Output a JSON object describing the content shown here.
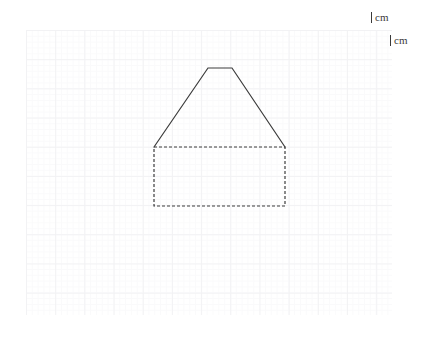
{
  "canvas": {
    "width": 436,
    "height": 338,
    "background_color": "#ffffff"
  },
  "grid": {
    "name": "graph-paper-grid",
    "left": 26,
    "top": 30,
    "width": 366,
    "height": 285,
    "major_cell_px": 29.2,
    "minor_cell_px": 5.84,
    "major_line_color": "#f2f2f4",
    "minor_line_color": "#fafafb"
  },
  "labels": {
    "vertical_scale": {
      "text": "cm",
      "tick": "|",
      "x": 371,
      "y": 12
    },
    "horizontal_scale": {
      "text": "cm",
      "tick": "|",
      "x": 390,
      "y": 35
    }
  },
  "figure": {
    "name": "house-pentagon-shape",
    "solid_line_color": "#3c3c3c",
    "solid_line_width": 1.2,
    "dashed_line_color": "#3c3c3c",
    "dashed_line_width": 1.2,
    "dash_pattern": "3,2",
    "roof": {
      "name": "trapezoid-roof",
      "style": "solid",
      "points": "154,147 208,68 232,68 285,147"
    },
    "roof_apex_top_edge": {
      "x1": 208,
      "y1": 68,
      "x2": 232,
      "y2": 68
    },
    "rectangle": {
      "name": "dashed-rectangle-base",
      "style": "dashed",
      "x": 154,
      "y": 147,
      "width": 131,
      "height": 59
    }
  }
}
